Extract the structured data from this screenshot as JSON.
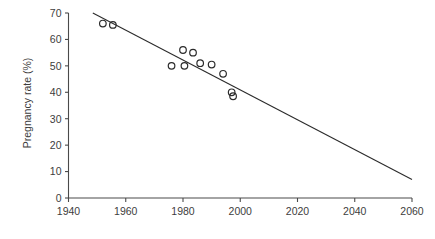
{
  "chart_data": {
    "type": "scatter",
    "title": "",
    "partial_cut_title": "",
    "xlabel": "",
    "ylabel": "Pregnancy rate (%)",
    "xlim": [
      1940,
      2060
    ],
    "ylim": [
      0,
      70
    ],
    "xticks": [
      1940,
      1960,
      1980,
      2000,
      2020,
      2040,
      2060
    ],
    "xtick_labels": [
      "1940",
      "1960",
      "1980",
      "2000",
      "2020",
      "2040",
      "2060"
    ],
    "yticks": [
      0,
      10,
      20,
      30,
      40,
      50,
      60,
      70
    ],
    "ytick_labels": [
      "0",
      "10",
      "20",
      "30",
      "40",
      "50",
      "60",
      "70"
    ],
    "grid": false,
    "legend": null,
    "marker": "open-circle",
    "series": [
      {
        "name": "Pregnancy rate",
        "x": [
          1952,
          1955.5,
          1976,
          1980,
          1980.5,
          1983.5,
          1986,
          1990,
          1994,
          1997,
          1997.5
        ],
        "y": [
          66,
          65.5,
          50,
          56,
          50,
          55,
          51,
          50.5,
          47,
          40,
          38.5
        ]
      }
    ],
    "trendline": {
      "type": "linear",
      "x_start": 1948.5,
      "y_start": 70,
      "x_end": 2060,
      "y_end": 7,
      "slope_per_year": -0.565,
      "color": "#2b2b2b"
    },
    "axis_color": "#4a4a4a",
    "marker_color": "#2b2b2b"
  }
}
